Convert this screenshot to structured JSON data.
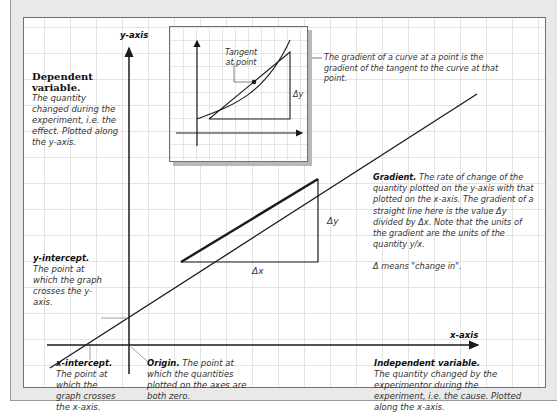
{
  "axes": {
    "y_label": "y-axis",
    "x_label": "x-axis"
  },
  "inset": {
    "tangent_label_line1": "Tangent",
    "tangent_label_line2": "at point",
    "delta_y": "Δy",
    "caption": "The gradient of a curve at a point is the gradient of the tangent to the curve at that point."
  },
  "annotations": {
    "dependent": {
      "title": "Dependent variable.",
      "body": "The quantity changed during the experiment, i.e. the effect. Plotted along the y-axis."
    },
    "y_intercept": {
      "title": "y-intercept.",
      "body": "The point at which the graph crosses the y-axis."
    },
    "x_intercept": {
      "title": "x-intercept.",
      "body": "The point at which the graph crosses the x-axis."
    },
    "origin": {
      "title": "Origin.",
      "body": "The point at which the quantities plotted on the axes are both zero."
    },
    "gradient": {
      "title": "Gradient.",
      "body": "The rate of change of the quantity plotted on the y-axis with that plotted on the x-axis. The gradient of a straight line here is the value Δy divided by Δx. Note that the units of the gradient are the units of the quantity y/x.",
      "note": "Δ means \"change in\"."
    },
    "independent": {
      "title": "Independent variable.",
      "body": "The quantity changed by the experimentor during the experiment, i.e. the cause. Plotted along the x-axis."
    }
  },
  "triangle": {
    "delta_x": "Δx",
    "delta_y": "Δy"
  },
  "colors": {
    "line": "#1a1a1a",
    "grid": "#e3e3e3",
    "frame": "#e9e9e9",
    "text": "#333333"
  }
}
